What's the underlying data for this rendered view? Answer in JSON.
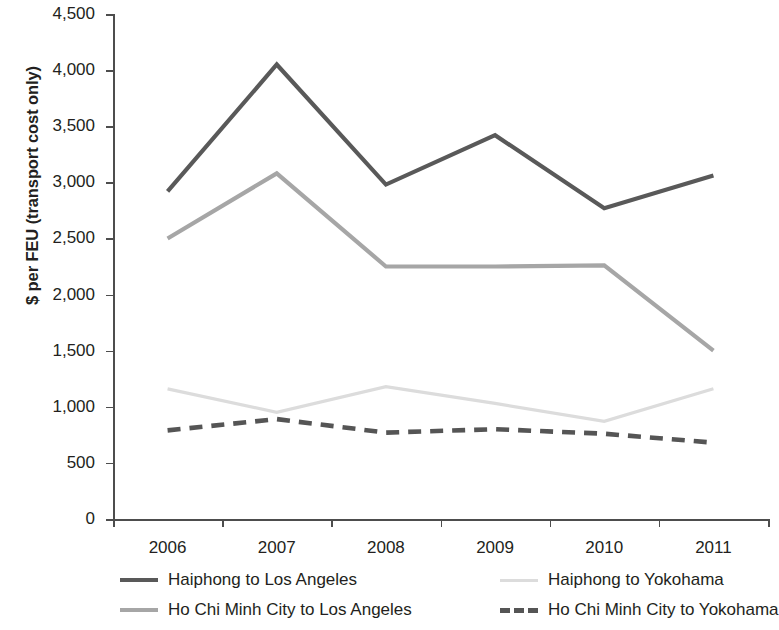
{
  "chart_data": {
    "type": "line",
    "title": "",
    "xlabel": "",
    "ylabel": "$ per FEU (transport cost only)",
    "categories": [
      "2006",
      "2007",
      "2008",
      "2009",
      "2010",
      "2011"
    ],
    "ylim": [
      0,
      4500
    ],
    "yticks": [
      0,
      500,
      1000,
      1500,
      2000,
      2500,
      3000,
      3500,
      4000,
      4500
    ],
    "ytick_labels": [
      "0",
      "500",
      "1,000",
      "1,500",
      "2,000",
      "2,500",
      "3,000",
      "3,500",
      "4,000",
      "4,500"
    ],
    "grid": false,
    "legend_position": "bottom",
    "series": [
      {
        "name": "Haiphong to Los Angeles",
        "values": [
          2920,
          4050,
          2980,
          3420,
          2770,
          3060
        ],
        "color": "#595959",
        "style": "solid",
        "width": 4.2
      },
      {
        "name": "Ho Chi Minh City to Los Angeles",
        "values": [
          2500,
          3080,
          2250,
          2250,
          2260,
          1500
        ],
        "color": "#a6a6a6",
        "style": "solid",
        "width": 4.2
      },
      {
        "name": "Haiphong to Yokohama",
        "values": [
          1160,
          950,
          1180,
          1030,
          870,
          1160
        ],
        "color": "#dcdcdc",
        "style": "solid",
        "width": 3.2
      },
      {
        "name": "Ho Chi Minh City to Yokohama",
        "values": [
          790,
          890,
          770,
          800,
          760,
          680
        ],
        "color": "#555555",
        "style": "dashed",
        "width": 4.6
      }
    ]
  },
  "legend": {
    "entries": [
      {
        "label": "Haiphong to Los Angeles"
      },
      {
        "label": "Haiphong to Yokohama"
      },
      {
        "label": "Ho Chi Minh City to Los Angeles"
      },
      {
        "label": "Ho Chi Minh City to Yokohama"
      }
    ]
  }
}
